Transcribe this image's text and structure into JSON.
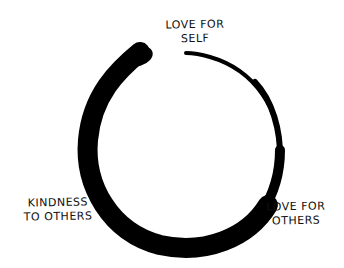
{
  "diagram": {
    "type": "enso-circle",
    "stroke_color": "#000000",
    "background": "#ffffff",
    "labels": {
      "top": {
        "line1": "LOVE FOR",
        "line2": "SELF"
      },
      "left": {
        "line1": "KINDNESS",
        "line2": "TO OTHERS"
      },
      "right": {
        "line1": "LOVE FOR",
        "line2": "OTHERS"
      }
    }
  }
}
